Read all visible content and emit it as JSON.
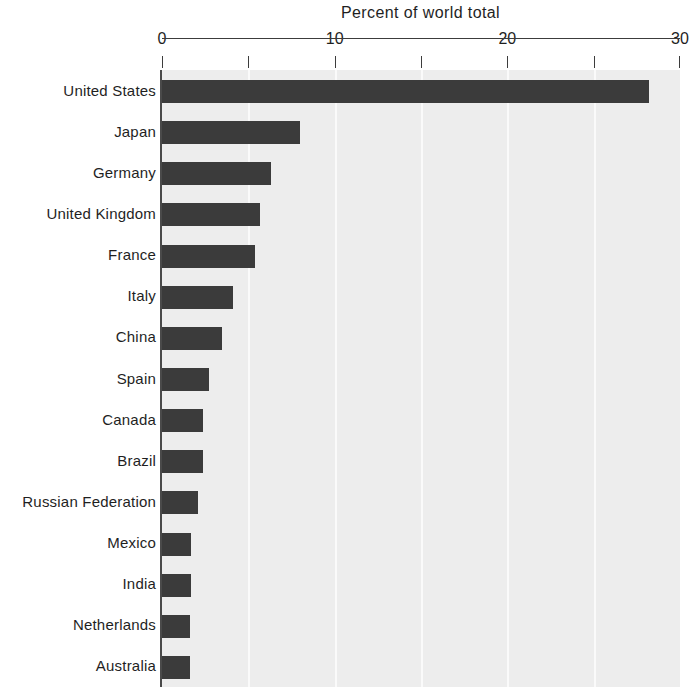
{
  "chart_data": {
    "type": "bar",
    "orientation": "horizontal",
    "title": "Percent of world total",
    "xlabel": "",
    "ylabel": "",
    "xlim": [
      0,
      30
    ],
    "xticks": [
      0,
      5,
      10,
      15,
      20,
      25,
      30
    ],
    "xtick_labels": [
      "0",
      "",
      "10",
      "",
      "20",
      "",
      "30"
    ],
    "grid": true,
    "grid_axis": "x",
    "legend": false,
    "categories": [
      "United States",
      "Japan",
      "Germany",
      "United Kingdom",
      "France",
      "Italy",
      "China",
      "Spain",
      "Canada",
      "Brazil",
      "Russian Federation",
      "Mexico",
      "India",
      "Netherlands",
      "Australia"
    ],
    "values": [
      28.2,
      8.0,
      6.3,
      5.7,
      5.4,
      4.1,
      3.5,
      2.7,
      2.4,
      2.4,
      2.1,
      1.7,
      1.7,
      1.6,
      1.6
    ],
    "colors": {
      "bar": "#3b3b3b",
      "plot_background": "#ededed",
      "gridline": "#fafafa",
      "axis": "#3c3c3c",
      "text": "#1f1f1f",
      "page_background": "#ffffff"
    }
  }
}
